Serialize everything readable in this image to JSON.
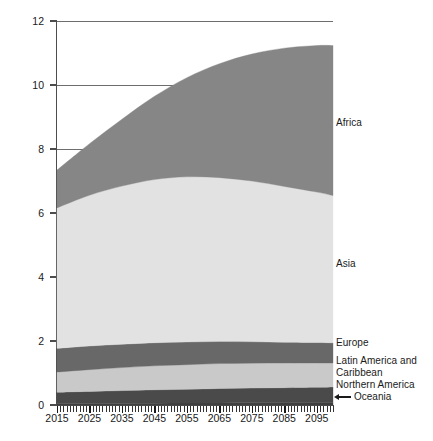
{
  "chart_data": {
    "type": "area",
    "title": "",
    "subtitle": "",
    "xlabel": "",
    "ylabel": "Billions",
    "xlim": [
      2015,
      2100
    ],
    "ylim": [
      0,
      12
    ],
    "grid": true,
    "stacked": true,
    "legend_position": "inline-right",
    "x_tick_labels": [
      "2015",
      "2025",
      "2035",
      "2045",
      "2055",
      "2065",
      "2075",
      "2085",
      "2095"
    ],
    "x_tick_values": [
      2015,
      2025,
      2035,
      2045,
      2055,
      2065,
      2075,
      2085,
      2095
    ],
    "y_tick_labels": [
      "0",
      "2",
      "4",
      "6",
      "8",
      "10",
      "12"
    ],
    "y_tick_values": [
      0,
      2,
      4,
      6,
      8,
      10,
      12
    ],
    "x": [
      2015,
      2025,
      2035,
      2045,
      2055,
      2065,
      2075,
      2085,
      2095,
      2100
    ],
    "series": [
      {
        "name": "Oceania",
        "color": "#3f3f3f",
        "values": [
          0.04,
          0.045,
          0.05,
          0.055,
          0.06,
          0.065,
          0.068,
          0.071,
          0.073,
          0.074
        ]
      },
      {
        "name": "Northern America",
        "color": "#4a4a4a",
        "values": [
          0.36,
          0.38,
          0.4,
          0.42,
          0.43,
          0.45,
          0.46,
          0.47,
          0.48,
          0.49
        ]
      },
      {
        "name": "Latin America and\nCaribbean",
        "color": "#c9c9c9",
        "values": [
          0.63,
          0.68,
          0.72,
          0.75,
          0.77,
          0.78,
          0.78,
          0.77,
          0.76,
          0.75
        ]
      },
      {
        "name": "Europe",
        "color": "#686868",
        "values": [
          0.74,
          0.74,
          0.73,
          0.72,
          0.71,
          0.69,
          0.67,
          0.65,
          0.64,
          0.63
        ]
      },
      {
        "name": "Asia",
        "color": "#e2e2e2",
        "values": [
          4.39,
          4.71,
          4.94,
          5.1,
          5.16,
          5.12,
          5.02,
          4.87,
          4.7,
          4.6
        ]
      },
      {
        "name": "Africa",
        "color": "#868686",
        "values": [
          1.18,
          1.61,
          2.09,
          2.6,
          3.1,
          3.56,
          3.97,
          4.32,
          4.58,
          4.69
        ]
      }
    ],
    "series_label_text": {
      "africa": "Africa",
      "asia": "Asia",
      "europe": "Europe",
      "latin_america": "Latin America and\nCaribbean",
      "northern_america": "Northern America",
      "oceania": "Oceania"
    }
  }
}
